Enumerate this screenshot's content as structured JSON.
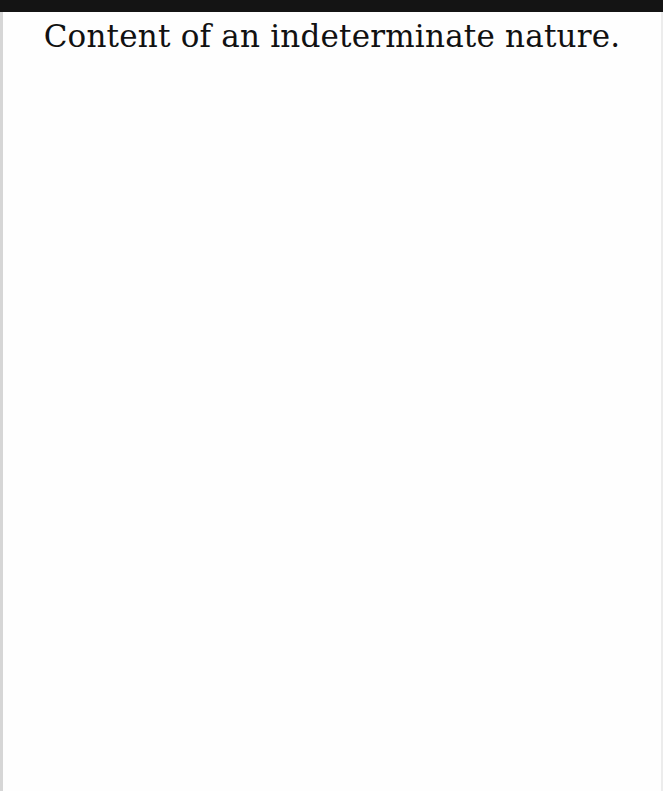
{
  "document": {
    "heading": "Content of an indeterminate nature."
  },
  "colors": {
    "top_band": "#141414",
    "page_background": "#fefefe",
    "text": "#111111"
  }
}
